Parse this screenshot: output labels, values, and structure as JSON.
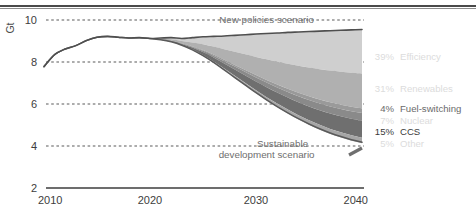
{
  "chart_data": {
    "type": "area",
    "title": "",
    "subtitle": "",
    "xlabel": "",
    "ylabel": "Gt",
    "unit": "Gt",
    "xlim": [
      2010,
      2040
    ],
    "ylim": [
      2,
      10
    ],
    "xticks": [
      2010,
      2020,
      2030,
      2040
    ],
    "xticklabels": [
      "2010",
      "2020",
      "2030",
      "2040"
    ],
    "yticks": [
      2,
      4,
      6,
      8,
      10
    ],
    "yticklabels": [
      "2",
      "4",
      "6",
      "8",
      "10"
    ],
    "grid": "dotted-horizontal",
    "legend_position": "right",
    "annotations": [
      {
        "name": "new-policies-scenario",
        "text": "New policies scenario",
        "x": 2031,
        "y": 9.85
      },
      {
        "name": "sustainable-development-scenario-line1",
        "text": "Sustainable",
        "x": 2032.5,
        "y": 3.95
      },
      {
        "name": "sustainable-development-scenario-line2",
        "text": "development scenario",
        "x": 2031,
        "y": 3.45
      }
    ],
    "x": [
      2010,
      2011,
      2012,
      2013,
      2014,
      2015,
      2016,
      2017,
      2018,
      2019,
      2020,
      2021,
      2022,
      2023,
      2024,
      2025,
      2026,
      2027,
      2028,
      2029,
      2030,
      2031,
      2032,
      2033,
      2034,
      2035,
      2036,
      2037,
      2038,
      2039,
      2040
    ],
    "series": [
      {
        "name": "New policies scenario",
        "role": "upper-boundary",
        "color": "#4f4f4f",
        "values": [
          7.78,
          8.35,
          8.62,
          8.78,
          9.02,
          9.18,
          9.22,
          9.18,
          9.14,
          9.16,
          9.12,
          9.14,
          9.16,
          9.12,
          9.16,
          9.2,
          9.22,
          9.24,
          9.27,
          9.3,
          9.33,
          9.36,
          9.38,
          9.41,
          9.43,
          9.45,
          9.47,
          9.49,
          9.51,
          9.53,
          9.55
        ]
      },
      {
        "name": "Sustainable development scenario",
        "role": "lower-boundary",
        "color": "#5a5a5a",
        "values": [
          7.78,
          8.35,
          8.62,
          8.78,
          9.02,
          9.18,
          9.22,
          9.18,
          9.14,
          9.16,
          9.12,
          9.06,
          8.96,
          8.8,
          8.58,
          8.3,
          7.98,
          7.62,
          7.26,
          6.9,
          6.54,
          6.2,
          5.88,
          5.58,
          5.3,
          5.05,
          4.82,
          4.62,
          4.45,
          4.3,
          4.18
        ]
      }
    ],
    "wedges": [
      {
        "name": "Efficiency",
        "pct": "39%",
        "label": "Efficiency",
        "share": 0.39,
        "color": "#cfcfcf"
      },
      {
        "name": "Renewables",
        "pct": "31%",
        "label": "Renewables",
        "share": 0.31,
        "color": "#b0b0b0"
      },
      {
        "name": "Fuel-switching",
        "pct": "4%",
        "label": "Fuel-switching",
        "share": 0.04,
        "color": "#9a9a9a"
      },
      {
        "name": "Nuclear",
        "pct": "7%",
        "label": "Nuclear",
        "share": 0.07,
        "color": "#8a8a8a"
      },
      {
        "name": "CCS",
        "pct": "15%",
        "label": "CCS",
        "share": 0.15,
        "color": "#6f6f6f"
      },
      {
        "name": "Other",
        "pct": "5%",
        "label": "Other",
        "share": 0.05,
        "color": "#a6a6a6"
      }
    ]
  },
  "legend": {
    "items": [
      {
        "pct": "39%",
        "label": "Efficiency",
        "emphasis": "low"
      },
      {
        "pct": "31%",
        "label": "Renewables",
        "emphasis": "low"
      },
      {
        "pct": "4%",
        "label": "Fuel-switching",
        "emphasis": "mid"
      },
      {
        "pct": "7%",
        "label": "Nuclear",
        "emphasis": "low"
      },
      {
        "pct": "15%",
        "label": "CCS",
        "emphasis": "high"
      },
      {
        "pct": "5%",
        "label": "Other",
        "emphasis": "low"
      }
    ]
  },
  "axes": {
    "unit": "Gt",
    "y_labels": [
      "10",
      "8",
      "6",
      "4",
      "2"
    ],
    "x_labels": [
      "2010",
      "2020",
      "2030",
      "2040"
    ]
  },
  "annotations": {
    "new_policies": "New policies scenario",
    "sustainable_1": "Sustainable",
    "sustainable_2": "development scenario"
  },
  "colors": {
    "line": "#4f4f4f",
    "grid": "#5a5a5a",
    "axis": "#3d3d3d",
    "topbar": "#4a4a4a"
  }
}
